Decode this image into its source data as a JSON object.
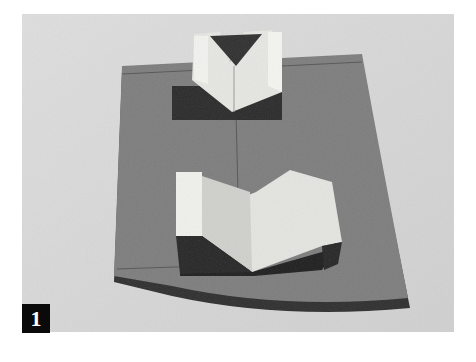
{
  "figure": {
    "number": "1",
    "colors": {
      "background": "#d9d9d9",
      "board": "#7d7d7d",
      "board_edge": "#2e2e2e",
      "block_light": "#e8e8e4",
      "block_shadow": "#2a2a2a",
      "badge": "#0a0a0a"
    }
  }
}
